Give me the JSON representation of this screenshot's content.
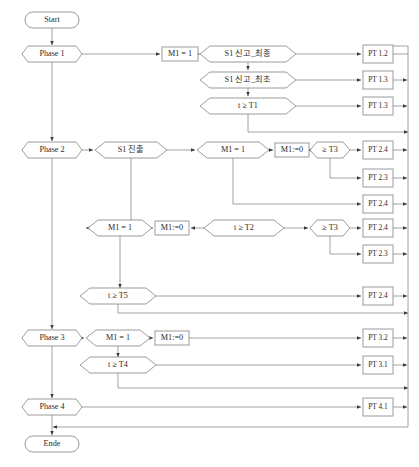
{
  "diagram": {
    "colors": {
      "stroke": "#8a8a8a",
      "text": "#2b2b2b",
      "background": "#ffffff"
    },
    "terminals": [
      {
        "id": "start",
        "label": "Start",
        "x": 52,
        "y": 20,
        "w": 54,
        "h": 16
      },
      {
        "id": "ende",
        "label": "Ende",
        "x": 52,
        "y": 444,
        "w": 54,
        "h": 16
      }
    ],
    "phases": [
      {
        "id": "phase1",
        "label": "Phase 1",
        "x": 52,
        "y": 54,
        "w": 60,
        "h": 16
      },
      {
        "id": "phase2",
        "label": "Phase 2",
        "x": 52,
        "y": 150,
        "w": 60,
        "h": 16
      },
      {
        "id": "phase3",
        "label": "Phase 3",
        "x": 52,
        "y": 338,
        "w": 60,
        "h": 16
      },
      {
        "id": "phase4",
        "label": "Phase 4",
        "x": 52,
        "y": 407,
        "w": 60,
        "h": 16
      }
    ],
    "conditions": [
      {
        "id": "c-s1-final",
        "label": "S1 신고_최종",
        "x": 248,
        "y": 54,
        "w": 96,
        "h": 16
      },
      {
        "id": "c-s1-first",
        "label": "S1 신고_최초",
        "x": 248,
        "y": 80,
        "w": 96,
        "h": 16
      },
      {
        "id": "c-t-ge-t1",
        "label": "t ≥ T1",
        "x": 248,
        "y": 106,
        "w": 96,
        "h": 16
      },
      {
        "id": "c-s1-jinchul",
        "label": "S1 진출",
        "x": 131,
        "y": 150,
        "w": 72,
        "h": 16
      },
      {
        "id": "c-m1-eq1-a",
        "label": "M1 = 1",
        "x": 233,
        "y": 150,
        "w": 72,
        "h": 16
      },
      {
        "id": "c-t-ge-t3-a",
        "label": "≥ T3",
        "x": 330,
        "y": 150,
        "w": 40,
        "h": 16
      },
      {
        "id": "c-m1-eq1-b",
        "label": "M1 = 1",
        "x": 120,
        "y": 228,
        "w": 64,
        "h": 16
      },
      {
        "id": "c-t-ge-t2",
        "label": "t ≥ T2",
        "x": 244,
        "y": 228,
        "w": 80,
        "h": 16
      },
      {
        "id": "c-t-ge-t3-b",
        "label": "≥ T3",
        "x": 330,
        "y": 228,
        "w": 40,
        "h": 16
      },
      {
        "id": "c-t-ge-t5",
        "label": "t ≥ T5",
        "x": 118,
        "y": 296,
        "w": 76,
        "h": 16
      },
      {
        "id": "c-m1-eq1-c",
        "label": "M1 = 1",
        "x": 118,
        "y": 338,
        "w": 64,
        "h": 16
      },
      {
        "id": "c-t-ge-t4",
        "label": "t ≥ T4",
        "x": 118,
        "y": 365,
        "w": 76,
        "h": 16
      }
    ],
    "actions": [
      {
        "id": "a-m1-1",
        "label": "M1 = 1",
        "x": 180,
        "y": 54,
        "w": 36,
        "h": 14
      },
      {
        "id": "a-m1-0-a",
        "label": "M1:=0",
        "x": 292,
        "y": 150,
        "w": 34,
        "h": 14
      },
      {
        "id": "a-m1-0-b",
        "label": "M1:=0",
        "x": 172,
        "y": 228,
        "w": 34,
        "h": 14
      },
      {
        "id": "a-m1-0-c",
        "label": "M1:=0",
        "x": 172,
        "y": 338,
        "w": 34,
        "h": 14
      }
    ],
    "pt_boxes": [
      {
        "id": "pt-1-2",
        "label": "PT 1.2",
        "x": 378,
        "y": 54,
        "w": 30,
        "h": 18
      },
      {
        "id": "pt-1-3-a",
        "label": "PT 1.3",
        "x": 378,
        "y": 80,
        "w": 30,
        "h": 18
      },
      {
        "id": "pt-1-3-b",
        "label": "PT 1.3",
        "x": 378,
        "y": 106,
        "w": 30,
        "h": 18
      },
      {
        "id": "pt-2-4-a",
        "label": "PT 2.4",
        "x": 378,
        "y": 150,
        "w": 30,
        "h": 18
      },
      {
        "id": "pt-2-3-a",
        "label": "PT 2.3",
        "x": 378,
        "y": 178,
        "w": 30,
        "h": 18
      },
      {
        "id": "pt-2-4-b",
        "label": "PT 2.4",
        "x": 378,
        "y": 204,
        "w": 30,
        "h": 18
      },
      {
        "id": "pt-2-4-c",
        "label": "PT 2.4",
        "x": 378,
        "y": 228,
        "w": 30,
        "h": 18
      },
      {
        "id": "pt-2-3-b",
        "label": "PT 2.3",
        "x": 378,
        "y": 254,
        "w": 30,
        "h": 18
      },
      {
        "id": "pt-2-4-d",
        "label": "PT 2.4",
        "x": 378,
        "y": 296,
        "w": 30,
        "h": 18
      },
      {
        "id": "pt-3-2",
        "label": "PT 3.2",
        "x": 378,
        "y": 338,
        "w": 30,
        "h": 18
      },
      {
        "id": "pt-3-1",
        "label": "PT 3.1",
        "x": 378,
        "y": 365,
        "w": 30,
        "h": 18
      },
      {
        "id": "pt-4-1",
        "label": "PT 4.1",
        "x": 378,
        "y": 407,
        "w": 30,
        "h": 18
      }
    ],
    "spine": {
      "x": 52,
      "return_x": 408,
      "bottom_return_y": 427
    }
  }
}
